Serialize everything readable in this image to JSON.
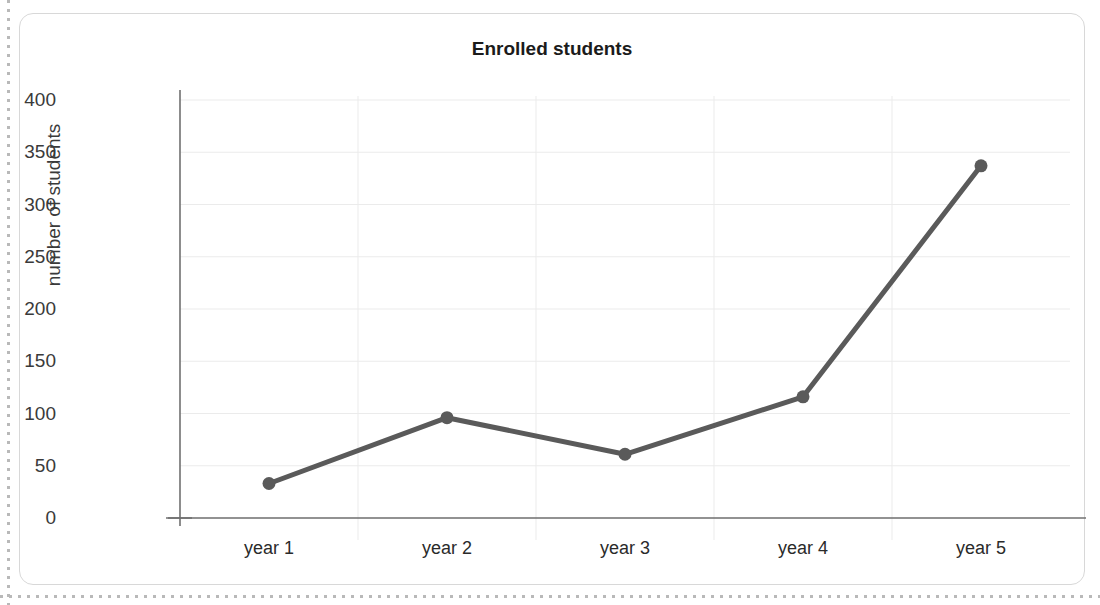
{
  "page": {
    "cutoff_text": "",
    "background_color": "#ffffff"
  },
  "card": {
    "border_color": "#d8d8d8",
    "corner_radius": "14px"
  },
  "chart_data": {
    "type": "line",
    "title": "Enrolled students",
    "xlabel": "",
    "ylabel": "number of students",
    "categories": [
      "year 1",
      "year 2",
      "year 3",
      "year 4",
      "year 5"
    ],
    "values": [
      33,
      96,
      61,
      116,
      337
    ],
    "series": [
      {
        "name": "Enrolled students",
        "values": [
          33,
          96,
          61,
          116,
          337
        ]
      }
    ],
    "ylim": [
      0,
      400
    ],
    "yticks": [
      0,
      50,
      100,
      150,
      200,
      250,
      300,
      350,
      400
    ],
    "ytick_labels": [
      "0",
      "50",
      "100",
      "150",
      "200",
      "250",
      "300",
      "350",
      "400"
    ],
    "xtick_labels": [
      "year 1",
      "year 2",
      "year 3",
      "year 4",
      "year 5"
    ],
    "grid": true,
    "grid_color": "#ebebeb",
    "legend": false,
    "legend_position": "none",
    "line_color": "#5a5a5a",
    "line_width": 5,
    "marker": "circle",
    "marker_size": 13,
    "marker_color": "#5a5a5a",
    "axis_color": "#707070",
    "spines": [
      "left",
      "bottom"
    ]
  }
}
